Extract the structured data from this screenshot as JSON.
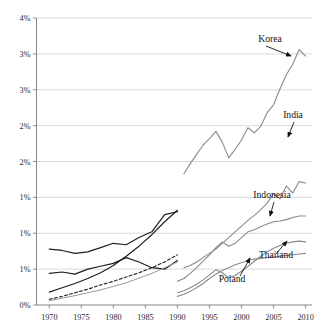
{
  "chart_data": {
    "type": "line",
    "title": "",
    "xlabel": "",
    "ylabel": "",
    "xlim": [
      1968,
      2011
    ],
    "ylim": [
      0,
      4
    ],
    "grid": true,
    "legend_position": "inline-annotations",
    "yticks": [
      "0%",
      "1%",
      "1%",
      "1%",
      "2%",
      "2%",
      "3%",
      "3%",
      "4%"
    ],
    "ytick_values": [
      0,
      0.5,
      1.0,
      1.5,
      2.0,
      2.5,
      3.0,
      3.5,
      4.0
    ],
    "xticks": [
      "1970",
      "1975",
      "1980",
      "1985",
      "1990",
      "1995",
      "2000",
      "2005",
      "2010"
    ],
    "xtick_values": [
      1970,
      1975,
      1980,
      1985,
      1990,
      1995,
      2000,
      2005,
      2010
    ],
    "series": [
      {
        "name": "Korea",
        "style": "solid",
        "color": "#8a8a8a",
        "width": 1.1,
        "x": [
          1991,
          1992,
          1993,
          1994,
          1995,
          1996,
          1997,
          1998,
          1999,
          2000,
          2001,
          2002,
          2003,
          2004,
          2005,
          2006,
          2007,
          2008,
          2009,
          2010
        ],
        "values": [
          1.83,
          1.97,
          2.1,
          2.23,
          2.32,
          2.42,
          2.27,
          2.05,
          2.17,
          2.3,
          2.47,
          2.4,
          2.49,
          2.68,
          2.79,
          3.01,
          3.21,
          3.36,
          3.56,
          3.47
        ]
      },
      {
        "name": "India",
        "style": "solid",
        "color": "#8a8a8a",
        "width": 1.1,
        "x": [
          1991,
          1992,
          1993,
          1994,
          1995,
          1996,
          1997,
          1998,
          1999,
          2000,
          2001,
          2002,
          2003,
          2004,
          2005,
          2006,
          2007,
          2008,
          2009,
          2010
        ],
        "values": [
          0.52,
          0.55,
          0.6,
          0.66,
          0.72,
          0.78,
          0.86,
          0.94,
          1.02,
          1.1,
          1.18,
          1.25,
          1.33,
          1.42,
          1.55,
          1.48,
          1.66,
          1.56,
          1.72,
          1.7
        ]
      },
      {
        "name": "Indonesia",
        "style": "solid",
        "color": "#8a8a8a",
        "width": 1.1,
        "x": [
          1990,
          1991,
          1992,
          1993,
          1994,
          1995,
          1996,
          1997,
          1998,
          1999,
          2000,
          2001,
          2002,
          2003,
          2004,
          2005,
          2006,
          2007,
          2008,
          2009,
          2010
        ],
        "values": [
          0.33,
          0.37,
          0.44,
          0.52,
          0.61,
          0.7,
          0.8,
          0.88,
          0.82,
          0.86,
          0.94,
          1.02,
          1.05,
          1.09,
          1.13,
          1.16,
          1.17,
          1.19,
          1.22,
          1.24,
          1.24
        ]
      },
      {
        "name": "Thailand",
        "style": "solid",
        "color": "#8a8a8a",
        "width": 1.1,
        "x": [
          1990,
          1991,
          1992,
          1993,
          1994,
          1995,
          1996,
          1997,
          1998,
          1999,
          2000,
          2001,
          2002,
          2003,
          2004,
          2005,
          2006,
          2007,
          2008,
          2009,
          2010
        ],
        "values": [
          0.17,
          0.2,
          0.24,
          0.29,
          0.35,
          0.42,
          0.49,
          0.45,
          0.38,
          0.41,
          0.47,
          0.54,
          0.61,
          0.68,
          0.74,
          0.79,
          0.83,
          0.86,
          0.88,
          0.89,
          0.88
        ]
      },
      {
        "name": "Poland",
        "style": "solid",
        "color": "#8a8a8a",
        "width": 1.1,
        "x": [
          1990,
          1991,
          1992,
          1993,
          1994,
          1995,
          1996,
          1997,
          1998,
          1999,
          2000,
          2001,
          2002,
          2003,
          2004,
          2005,
          2006,
          2007,
          2008,
          2009,
          2010
        ],
        "values": [
          0.12,
          0.15,
          0.19,
          0.24,
          0.3,
          0.37,
          0.43,
          0.48,
          0.52,
          0.56,
          0.59,
          0.62,
          0.64,
          0.65,
          0.66,
          0.67,
          0.68,
          0.69,
          0.7,
          0.71,
          0.72
        ]
      },
      {
        "name": "historical-a",
        "style": "solid",
        "color": "#1f1f1f",
        "width": 1.2,
        "x": [
          1970,
          1972,
          1974,
          1976,
          1978,
          1980,
          1982,
          1984,
          1986,
          1988,
          1990
        ],
        "values": [
          0.78,
          0.76,
          0.72,
          0.74,
          0.8,
          0.86,
          0.84,
          0.94,
          1.02,
          1.26,
          1.3
        ]
      },
      {
        "name": "historical-b",
        "style": "solid",
        "color": "#1f1f1f",
        "width": 1.2,
        "x": [
          1970,
          1972,
          1974,
          1976,
          1978,
          1980,
          1982,
          1984,
          1986,
          1988,
          1990
        ],
        "values": [
          0.44,
          0.46,
          0.43,
          0.5,
          0.54,
          0.58,
          0.66,
          0.6,
          0.52,
          0.5,
          0.62
        ]
      },
      {
        "name": "historical-c",
        "style": "solid",
        "color": "#1f1f1f",
        "width": 1.2,
        "x": [
          1970,
          1972,
          1974,
          1976,
          1978,
          1980,
          1982,
          1984,
          1986,
          1988,
          1990
        ],
        "values": [
          0.18,
          0.24,
          0.3,
          0.37,
          0.45,
          0.55,
          0.68,
          0.82,
          0.98,
          1.16,
          1.32
        ]
      },
      {
        "name": "historical-d-dashed",
        "style": "dashed",
        "color": "#1f1f1f",
        "width": 1.1,
        "x": [
          1970,
          1972,
          1974,
          1976,
          1978,
          1980,
          1982,
          1984,
          1986,
          1988,
          1990
        ],
        "values": [
          0.08,
          0.12,
          0.17,
          0.22,
          0.28,
          0.33,
          0.39,
          0.45,
          0.52,
          0.6,
          0.7
        ]
      },
      {
        "name": "historical-e",
        "style": "solid",
        "color": "#9a9a9a",
        "width": 1.0,
        "x": [
          1970,
          1974,
          1978,
          1982,
          1986,
          1990
        ],
        "values": [
          0.06,
          0.13,
          0.21,
          0.31,
          0.44,
          0.6
        ]
      }
    ],
    "annotations": [
      {
        "label": "Korea",
        "label_x": 270,
        "label_y": 42,
        "arrow_from": [
          266,
          46
        ],
        "arrow_to": [
          291,
          56
        ]
      },
      {
        "label": "India",
        "label_x": 293,
        "label_y": 118,
        "arrow_from": [
          294,
          122
        ],
        "arrow_to": [
          288,
          137
        ]
      },
      {
        "label": "Indonesia",
        "label_x": 272,
        "label_y": 198,
        "arrow_from": [
          274,
          202
        ],
        "arrow_to": [
          270,
          216
        ]
      },
      {
        "label": "Thailand",
        "label_x": 276,
        "label_y": 258,
        "arrow_from": [
          276,
          254
        ],
        "arrow_to": [
          287,
          241
        ]
      },
      {
        "label": "Poland",
        "label_x": 232,
        "label_y": 282,
        "arrow_from": [
          240,
          276
        ],
        "arrow_to": [
          250,
          258
        ]
      }
    ]
  }
}
